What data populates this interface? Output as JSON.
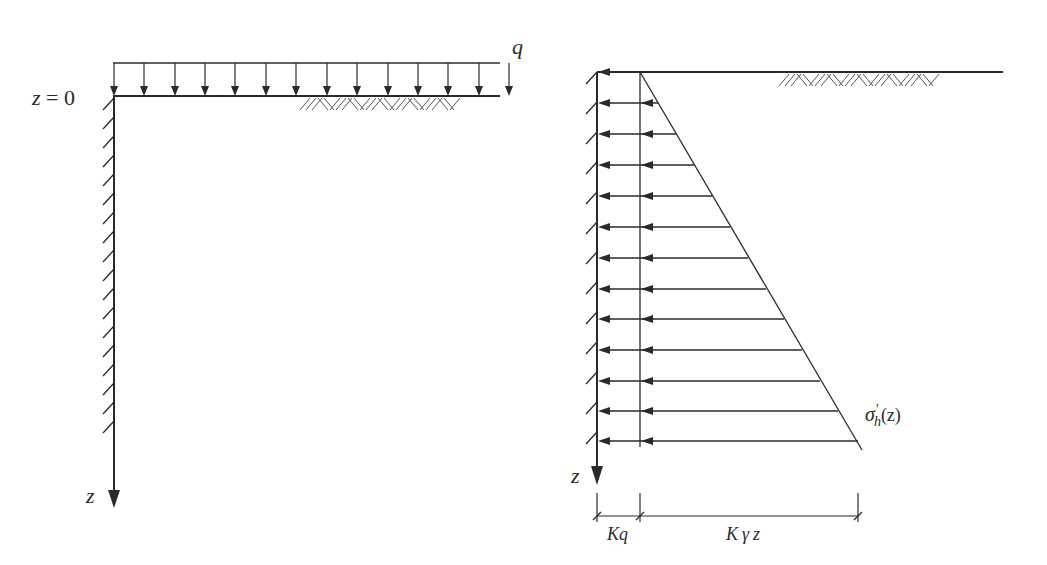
{
  "figure": {
    "left_panel": {
      "title": "surcharge loaded wall",
      "labels": {
        "surcharge": "q",
        "origin_var": "z",
        "origin_eq": " = 0",
        "depth_axis": "z"
      },
      "load_arrow_count": 14
    },
    "right_panel": {
      "title": "lateral earth pressure distribution",
      "labels": {
        "stress_sym": "σ",
        "stress_sub": "h",
        "stress_prime": "'",
        "stress_arg": "(z)",
        "depth_axis": "z",
        "dim_surcharge": "Kq",
        "dim_soil_k": "K",
        "dim_soil_gamma": "γ",
        "dim_soil_z": "z"
      },
      "pressure_arrow_count": 13
    },
    "colors": {
      "line": "#2a2a2a",
      "background": "#ffffff"
    }
  }
}
